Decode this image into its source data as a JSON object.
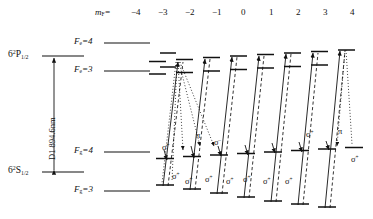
{
  "figure": {
    "type": "energy-level-diagram",
    "mf_header": "m",
    "mf_header_sub": "F",
    "mf_header_eq": "=",
    "mf_values": [
      "−4",
      "−3",
      "−2",
      "−1",
      "0",
      "1",
      "2",
      "3",
      "4"
    ],
    "transition_label": "D1 894.6nm",
    "states": [
      {
        "name": "excited-term",
        "text": "6",
        "sup": "2",
        "core": "P",
        "sub": "1/2"
      },
      {
        "name": "ground-term",
        "text": "6",
        "sup": "2",
        "core": "S",
        "sub": "1/2"
      }
    ],
    "hyperfine_levels": [
      {
        "id": "Fe4",
        "letter": "F",
        "sub": "e",
        "eq": "=",
        "value": "4",
        "kind": "excited"
      },
      {
        "id": "Fe3",
        "letter": "F",
        "sub": "e",
        "eq": "=",
        "value": "3",
        "kind": "excited"
      },
      {
        "id": "Fg4",
        "letter": "F",
        "sub": "g",
        "eq": "=",
        "value": "4",
        "kind": "ground"
      },
      {
        "id": "Fg3",
        "letter": "F",
        "sub": "g",
        "eq": "=",
        "value": "3",
        "kind": "ground"
      }
    ],
    "polarization_labels": [
      {
        "id": "p1",
        "text": "σ",
        "sup": "+",
        "x": 162,
        "y": 143
      },
      {
        "id": "p2",
        "text": "π",
        "sup": "",
        "x": 196,
        "y": 131
      },
      {
        "id": "p3",
        "text": "σ",
        "sup": "−",
        "x": 214,
        "y": 138
      },
      {
        "id": "p4",
        "text": "σ",
        "sup": "+",
        "x": 306,
        "y": 130
      },
      {
        "id": "p5",
        "text": "π",
        "sup": "",
        "x": 338,
        "y": 127
      },
      {
        "id": "p6",
        "text": "σ",
        "sup": "+",
        "x": 351,
        "y": 155
      },
      {
        "id": "p7",
        "text": "σ",
        "sup": "+",
        "x": 172,
        "y": 172
      },
      {
        "id": "p8",
        "text": "σ",
        "sup": "+",
        "x": 185,
        "y": 177
      },
      {
        "id": "p9",
        "text": "σ",
        "sup": "+",
        "x": 205,
        "y": 175
      },
      {
        "id": "p10",
        "text": "σ",
        "sup": "+",
        "x": 226,
        "y": 177
      },
      {
        "id": "p11",
        "text": "σ",
        "sup": "+",
        "x": 243,
        "y": 175
      },
      {
        "id": "p12",
        "text": "σ",
        "sup": "+",
        "x": 263,
        "y": 177
      },
      {
        "id": "p13",
        "text": "σ",
        "sup": "+",
        "x": 285,
        "y": 177
      }
    ],
    "colors": {
      "ink": "#111111",
      "rule": "#1a1a1a"
    }
  }
}
